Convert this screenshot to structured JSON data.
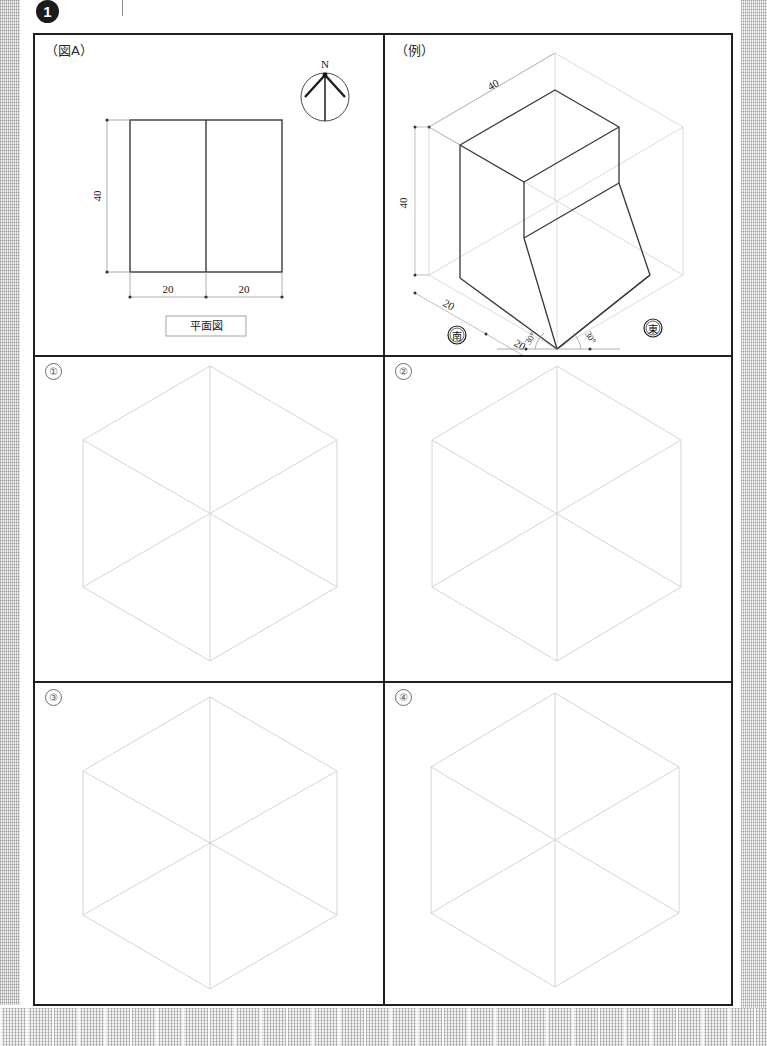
{
  "header": {
    "question_number": "1"
  },
  "panels": {
    "figure_a": {
      "label": "（図A）",
      "compass": {
        "north_label": "N",
        "name": "compass-rose"
      },
      "plan": {
        "caption": "平面図",
        "height_dim": "40",
        "width_dim_left": "20",
        "width_dim_right": "20"
      }
    },
    "example": {
      "label": "（例）",
      "dims": {
        "top_depth": "40",
        "height": "40",
        "bottom_left": "20",
        "bottom_mid": "20",
        "angle_left": "30°",
        "angle_right": "30°"
      },
      "direction_marks": {
        "south": "南",
        "east": "東"
      }
    },
    "options": [
      {
        "label": "①",
        "name": "option-1",
        "content": "empty-isometric-grid"
      },
      {
        "label": "②",
        "name": "option-2",
        "content": "empty-isometric-grid"
      },
      {
        "label": "③",
        "name": "option-3",
        "content": "empty-isometric-grid"
      },
      {
        "label": "④",
        "name": "option-4",
        "content": "empty-isometric-grid"
      }
    ]
  },
  "colors": {
    "frame": "#1f1f1f",
    "object_line": "#3a3a3a",
    "construction_line": "#cfcfcf",
    "dimension_line": "#9a9a9a",
    "text": "#222222"
  }
}
